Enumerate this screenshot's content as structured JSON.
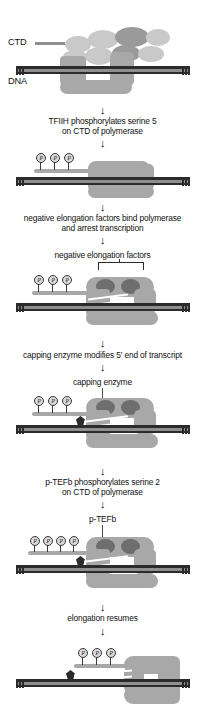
{
  "figure": {
    "type": "biological-process-diagram"
  },
  "labels": {
    "ctd": "CTD",
    "dna": "DNA",
    "negative_elongation_factors": "negative elongation factors",
    "capping_enzyme": "capping enzyme",
    "ptefb": "p-TEFb",
    "phosphate": "P"
  },
  "captions": [
    {
      "id": "step-1",
      "text_line1": "TFIIH phosphorylates serine 5",
      "text_line2": "on CTD of polymerase"
    },
    {
      "id": "step-2",
      "text_line1": "negative elongation factors bind polymerase",
      "text_line2": "and arrest transcription"
    },
    {
      "id": "step-3",
      "text_line1": "capping enzyme modifies 5′ end of transcript",
      "text_line2": ""
    },
    {
      "id": "step-4",
      "text_line1": "p-TEFb phosphorylates serine 2",
      "text_line2": "on CTD of polymerase"
    },
    {
      "id": "step-5",
      "text_line1": "elongation resumes",
      "text_line2": ""
    }
  ],
  "arrow_glyph": "↓",
  "panels": [
    {
      "id": "panel-initiation",
      "phosphate_count": 0,
      "has_cap": false,
      "has_nef": false,
      "has_gtf_complex": true
    },
    {
      "id": "panel-ser5-phos",
      "phosphate_count": 3,
      "has_cap": false,
      "has_nef": false,
      "has_gtf_complex": false
    },
    {
      "id": "panel-nef-bound",
      "phosphate_count": 3,
      "has_cap": false,
      "has_nef": true,
      "has_gtf_complex": false
    },
    {
      "id": "panel-capped",
      "phosphate_count": 3,
      "has_cap": true,
      "has_nef": true,
      "has_gtf_complex": false
    },
    {
      "id": "panel-ptefb",
      "phosphate_count": 4,
      "has_cap": true,
      "has_nef": true,
      "has_gtf_complex": false
    },
    {
      "id": "panel-elongation",
      "phosphate_count": 3,
      "has_cap": true,
      "has_nef": false,
      "has_gtf_complex": false
    }
  ],
  "colors": {
    "dna_strand": "#2b2b2b",
    "polymerase": "#a8a8a8",
    "factor_blob": "#c9c9c9",
    "factor_blob_dark": "#9a9a9a",
    "negative_factor": "#6e6e6e",
    "cap": "#2b2b2b",
    "rna_transcript": "#ffffff",
    "background": "#ffffff",
    "text": "#111111"
  }
}
